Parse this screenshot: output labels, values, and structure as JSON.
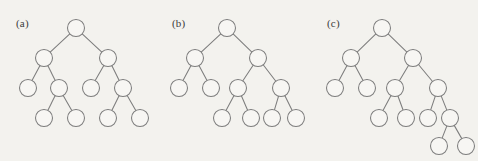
{
  "figure": {
    "background_color": "#f3f2ee",
    "node_fill_color": "#f7f6f3",
    "stroke_color": "#7d7d7d",
    "width": 478,
    "height": 161,
    "panels": [
      {
        "id": "a",
        "label": "(a)",
        "label_x": 16,
        "label_y": 17,
        "node_radius": 8.5,
        "nodes": [
          {
            "id": "a0",
            "x": 76,
            "y": 28,
            "level": 0
          },
          {
            "id": "a1",
            "x": 44,
            "y": 58,
            "level": 1
          },
          {
            "id": "a2",
            "x": 108,
            "y": 58,
            "level": 1
          },
          {
            "id": "a3",
            "x": 28,
            "y": 88,
            "level": 2
          },
          {
            "id": "a4",
            "x": 59,
            "y": 88,
            "level": 2
          },
          {
            "id": "a5",
            "x": 91,
            "y": 88,
            "level": 2
          },
          {
            "id": "a6",
            "x": 123,
            "y": 88,
            "level": 2
          },
          {
            "id": "a7",
            "x": 44,
            "y": 118,
            "level": 3
          },
          {
            "id": "a8",
            "x": 76,
            "y": 118,
            "level": 3
          },
          {
            "id": "a9",
            "x": 108,
            "y": 118,
            "level": 3
          },
          {
            "id": "a10",
            "x": 140,
            "y": 118,
            "level": 3
          }
        ],
        "edges": [
          [
            "a0",
            "a1"
          ],
          [
            "a0",
            "a2"
          ],
          [
            "a1",
            "a3"
          ],
          [
            "a1",
            "a4"
          ],
          [
            "a2",
            "a5"
          ],
          [
            "a2",
            "a6"
          ],
          [
            "a4",
            "a7"
          ],
          [
            "a4",
            "a8"
          ],
          [
            "a6",
            "a9"
          ],
          [
            "a6",
            "a10"
          ]
        ]
      },
      {
        "id": "b",
        "label": "(b)",
        "label_x": 172,
        "label_y": 17,
        "node_radius": 8.5,
        "nodes": [
          {
            "id": "b0",
            "x": 227,
            "y": 28,
            "level": 0
          },
          {
            "id": "b1",
            "x": 195,
            "y": 58,
            "level": 1
          },
          {
            "id": "b2",
            "x": 258,
            "y": 58,
            "level": 1
          },
          {
            "id": "b3",
            "x": 179,
            "y": 88,
            "level": 2
          },
          {
            "id": "b4",
            "x": 211,
            "y": 88,
            "level": 2
          },
          {
            "id": "b5",
            "x": 238,
            "y": 88,
            "level": 2
          },
          {
            "id": "b6",
            "x": 281,
            "y": 88,
            "level": 2
          },
          {
            "id": "b7",
            "x": 222,
            "y": 118,
            "level": 3
          },
          {
            "id": "b8",
            "x": 251,
            "y": 118,
            "level": 3
          },
          {
            "id": "b9",
            "x": 272,
            "y": 118,
            "level": 3
          },
          {
            "id": "b10",
            "x": 296,
            "y": 118,
            "level": 3
          }
        ],
        "edges": [
          [
            "b0",
            "b1"
          ],
          [
            "b0",
            "b2"
          ],
          [
            "b1",
            "b3"
          ],
          [
            "b1",
            "b4"
          ],
          [
            "b2",
            "b5"
          ],
          [
            "b2",
            "b6"
          ],
          [
            "b5",
            "b7"
          ],
          [
            "b5",
            "b8"
          ],
          [
            "b6",
            "b9"
          ],
          [
            "b6",
            "b10"
          ]
        ]
      },
      {
        "id": "c",
        "label": "(c)",
        "label_x": 327,
        "label_y": 17,
        "node_radius": 8.5,
        "nodes": [
          {
            "id": "c0",
            "x": 382,
            "y": 28,
            "level": 0
          },
          {
            "id": "c1",
            "x": 351,
            "y": 58,
            "level": 1
          },
          {
            "id": "c2",
            "x": 413,
            "y": 58,
            "level": 1
          },
          {
            "id": "c3",
            "x": 335,
            "y": 88,
            "level": 2
          },
          {
            "id": "c4",
            "x": 367,
            "y": 88,
            "level": 2
          },
          {
            "id": "c5",
            "x": 395,
            "y": 88,
            "level": 2
          },
          {
            "id": "c6",
            "x": 438,
            "y": 88,
            "level": 2
          },
          {
            "id": "c7",
            "x": 379,
            "y": 118,
            "level": 3
          },
          {
            "id": "c8",
            "x": 406,
            "y": 118,
            "level": 3
          },
          {
            "id": "c9",
            "x": 428,
            "y": 118,
            "level": 3
          },
          {
            "id": "c10",
            "x": 450,
            "y": 118,
            "level": 3
          },
          {
            "id": "c11",
            "x": 439,
            "y": 146,
            "level": 4
          },
          {
            "id": "c12",
            "x": 466,
            "y": 146,
            "level": 4
          }
        ],
        "edges": [
          [
            "c0",
            "c1"
          ],
          [
            "c0",
            "c2"
          ],
          [
            "c1",
            "c3"
          ],
          [
            "c1",
            "c4"
          ],
          [
            "c2",
            "c5"
          ],
          [
            "c2",
            "c6"
          ],
          [
            "c5",
            "c7"
          ],
          [
            "c5",
            "c8"
          ],
          [
            "c6",
            "c9"
          ],
          [
            "c6",
            "c10"
          ],
          [
            "c10",
            "c11"
          ],
          [
            "c10",
            "c12"
          ]
        ]
      }
    ]
  }
}
